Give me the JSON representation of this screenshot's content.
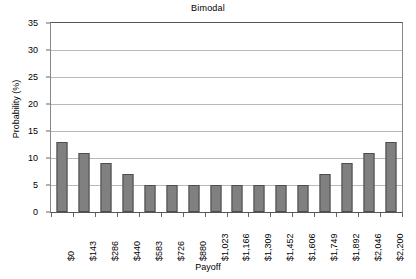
{
  "chart_data": {
    "type": "bar",
    "title": "Bimodal",
    "xlabel": "Payoff",
    "ylabel": "Probability (%)",
    "categories": [
      "$0",
      "$143",
      "$286",
      "$440",
      "$583",
      "$726",
      "$880",
      "$1,023",
      "$1,166",
      "$1,309",
      "$1,452",
      "$1,606",
      "$1,749",
      "$1,892",
      "$2,046",
      "$2,200"
    ],
    "values": [
      13,
      11,
      9,
      7,
      5,
      5,
      5,
      5,
      5,
      5,
      5,
      5,
      7,
      9,
      11,
      13
    ],
    "ylim": [
      0,
      35
    ],
    "yticks": [
      0,
      5,
      10,
      15,
      20,
      25,
      30,
      35
    ],
    "ytick_labels": [
      "0",
      "5",
      "10",
      "15",
      "20",
      "25",
      "30",
      "35"
    ],
    "grid": "horizontal",
    "legend": "none",
    "series_color": "#808080",
    "series_border_color": "#4d4d4d",
    "gridline_color": "#b9b9b9",
    "axis_color": "#555555",
    "plot_background": "#ffffff"
  }
}
